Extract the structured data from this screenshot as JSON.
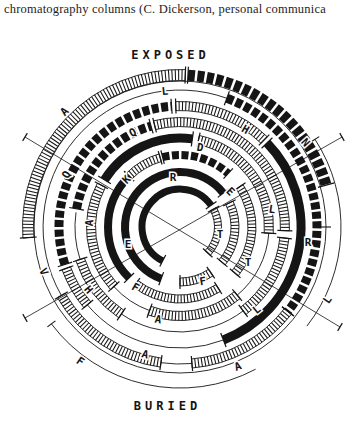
{
  "caption": "chromatography columns (C. Dickerson, personal communica",
  "labels": {
    "exposed": "EXPOSED",
    "buried": "BURIED"
  },
  "colors": {
    "ink": "#151515",
    "background": "#ffffff"
  },
  "diagram": {
    "center": {
      "x": 180,
      "y": 227
    },
    "cross_lines": [
      {
        "x1": 25,
        "y1": 137,
        "x2": 340,
        "y2": 327
      },
      {
        "x1": 342,
        "y1": 137,
        "x2": 25,
        "y2": 318
      }
    ],
    "rings": [
      {
        "r": 38,
        "w": 7,
        "segments": [
          {
            "a0": 207,
            "a1": 415,
            "style": "black"
          },
          {
            "a0": 62,
            "a1": 133,
            "style": "hatched"
          }
        ]
      },
      {
        "r": 55,
        "w": 8,
        "segments": [
          {
            "a0": 200,
            "a1": 412,
            "style": "black"
          },
          {
            "a0": 64,
            "a1": 130,
            "style": "hatched"
          },
          {
            "a0": 146,
            "a1": 180,
            "style": "hatched"
          }
        ]
      },
      {
        "r": 72,
        "w": 8,
        "segments": [
          {
            "a0": 225,
            "a1": 315,
            "style": "black"
          },
          {
            "a0": 315,
            "a1": 344,
            "style": "hatched"
          },
          {
            "a0": 346,
            "a1": 402,
            "style": "dashed"
          },
          {
            "a0": 56,
            "a1": 130,
            "style": "hatched"
          },
          {
            "a0": 148,
            "a1": 218,
            "style": "hatched"
          }
        ]
      },
      {
        "r": 89,
        "w": 9,
        "segments": [
          {
            "a0": 228,
            "a1": 298,
            "style": "hatched"
          },
          {
            "a0": 302,
            "a1": 368,
            "style": "black"
          },
          {
            "a0": 12,
            "a1": 94,
            "style": "hatched"
          },
          {
            "a0": 94,
            "a1": 140,
            "style": "thin"
          },
          {
            "a0": 140,
            "a1": 200,
            "style": "hatched"
          },
          {
            "a0": 200,
            "a1": 228,
            "style": "thin"
          }
        ]
      },
      {
        "r": 105,
        "w": 9,
        "segments": [
          {
            "a0": 214,
            "a1": 252,
            "style": "hatched"
          },
          {
            "a0": 252,
            "a1": 278,
            "style": "thin"
          },
          {
            "a0": 280,
            "a1": 344,
            "style": "dashed"
          },
          {
            "a0": 346,
            "a1": 452,
            "style": "hatched"
          },
          {
            "a0": 96,
            "a1": 143,
            "style": "hatched"
          },
          {
            "a0": 143,
            "a1": 214,
            "style": "thin"
          }
        ]
      },
      {
        "r": 121,
        "w": 9,
        "segments": [
          {
            "a0": 252,
            "a1": 356,
            "style": "dashed"
          },
          {
            "a0": 358,
            "a1": 404,
            "style": "hatched"
          },
          {
            "a0": 46,
            "a1": 159,
            "style": "black"
          },
          {
            "a0": 159,
            "a1": 230,
            "style": "thin"
          },
          {
            "a0": 230,
            "a1": 250,
            "style": "hatched"
          }
        ]
      },
      {
        "r": 137,
        "w": 9,
        "segments": [
          {
            "a0": 240,
            "a1": 380,
            "style": "thin"
          },
          {
            "a0": 20,
            "a1": 128,
            "style": "dashed"
          },
          {
            "a0": 128,
            "a1": 175,
            "style": "hatched"
          },
          {
            "a0": 175,
            "a1": 188,
            "style": "thin"
          },
          {
            "a0": 188,
            "a1": 240,
            "style": "hatched"
          }
        ]
      },
      {
        "r": 146,
        "w": 2,
        "segments": [
          {
            "a0": 0,
            "a1": 360,
            "style": "thin"
          }
        ]
      },
      {
        "r": 161,
        "w": 2,
        "segments": [
          {
            "a0": 57,
            "a1": 128,
            "style": "thin"
          },
          {
            "a0": 152,
            "a1": 233,
            "style": "thin"
          }
        ]
      },
      {
        "r": 152,
        "w": 11,
        "segments": [
          {
            "a0": 266,
            "a1": 362,
            "style": "hatched"
          },
          {
            "a0": 3,
            "a1": 74,
            "style": "dashed"
          }
        ]
      }
    ],
    "extra_ticks": [
      {
        "r": 161,
        "a": 57
      },
      {
        "r": 161,
        "a": 233
      },
      {
        "r": 146,
        "a": 90
      }
    ],
    "letters": [
      {
        "ch": "A",
        "x": 65,
        "y": 112,
        "rot": -45
      },
      {
        "ch": "L",
        "x": 165,
        "y": 92,
        "rot": -6
      },
      {
        "ch": "Q",
        "x": 133,
        "y": 133,
        "rot": -27
      },
      {
        "ch": "Q",
        "x": 67,
        "y": 175,
        "rot": -62
      },
      {
        "ch": "K",
        "x": 127,
        "y": 180,
        "rot": -45
      },
      {
        "ch": "R",
        "x": 173,
        "y": 178,
        "rot": 0
      },
      {
        "ch": "A",
        "x": 90,
        "y": 223,
        "rot": -85
      },
      {
        "ch": "H",
        "x": 245,
        "y": 130,
        "rot": 30
      },
      {
        "ch": "N",
        "x": 305,
        "y": 143,
        "rot": 48
      },
      {
        "ch": "D",
        "x": 200,
        "y": 148,
        "rot": 10
      },
      {
        "ch": "E",
        "x": 230,
        "y": 192,
        "rot": 45
      },
      {
        "ch": "L",
        "x": 272,
        "y": 210,
        "rot": 8
      },
      {
        "ch": "E",
        "x": 128,
        "y": 245,
        "rot": 0
      },
      {
        "ch": "V",
        "x": 43,
        "y": 272,
        "rot": 65
      },
      {
        "ch": "H",
        "x": 88,
        "y": 290,
        "rot": 50
      },
      {
        "ch": "F",
        "x": 135,
        "y": 288,
        "rot": 30
      },
      {
        "ch": "A",
        "x": 158,
        "y": 320,
        "rot": 10
      },
      {
        "ch": "A",
        "x": 145,
        "y": 355,
        "rot": 15
      },
      {
        "ch": "F",
        "x": 80,
        "y": 362,
        "rot": 35
      },
      {
        "ch": "T",
        "x": 220,
        "y": 235,
        "rot": 0
      },
      {
        "ch": "T",
        "x": 248,
        "y": 263,
        "rot": 0
      },
      {
        "ch": "F",
        "x": 203,
        "y": 282,
        "rot": -10
      },
      {
        "ch": "R",
        "x": 308,
        "y": 243,
        "rot": 0
      },
      {
        "ch": "L",
        "x": 328,
        "y": 300,
        "rot": -55
      },
      {
        "ch": "L",
        "x": 257,
        "y": 310,
        "rot": -40
      },
      {
        "ch": "A",
        "x": 238,
        "y": 367,
        "rot": -20
      }
    ]
  }
}
